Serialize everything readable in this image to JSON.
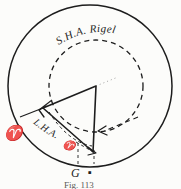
{
  "figure": {
    "background_color": "#fcfcfa",
    "ink_color": "#1d1d1d"
  },
  "labels": {
    "sha_rigel": "S.H.A. Rigel",
    "lha_aries": "L.H.A.",
    "lha_aries_symbol": "♈",
    "aries_point": "♈",
    "greenwich": "G",
    "observer_marker": "▪",
    "caption": "Fig. 113"
  },
  "diagram_data": {
    "type": "geometric-diagram",
    "outer_circle": {
      "cx": 90,
      "cy": 86,
      "r": 82,
      "style": "solid",
      "name": "celestial-equator-horizon"
    },
    "inner_circle": {
      "cx": 96,
      "cy": 86,
      "r": 47,
      "style": "dashed",
      "name": "sha-arc-circle"
    },
    "vertices": {
      "center_apex": {
        "x": 96,
        "y": 86,
        "name": "pole"
      },
      "aries_vertex": {
        "x": 43,
        "y": 108,
        "name": "aries-direction"
      },
      "greenwich_vertex": {
        "x": 93,
        "y": 152,
        "name": "greenwich-meridian"
      }
    },
    "angles": [
      {
        "name": "S.H.A. Rigel",
        "arc": "dashed-upper",
        "label_position": "top"
      },
      {
        "name": "L.H.A. Aries",
        "arc": "dashed-lower-left",
        "label_position": "lower-left"
      }
    ],
    "arrows": [
      {
        "name": "lha-arrow",
        "x": 40,
        "y": 110,
        "direction": "up-left"
      },
      {
        "name": "sha-arrow",
        "x": 99,
        "y": 131,
        "direction": "left"
      },
      {
        "name": "meridian-arrow",
        "x": 95,
        "y": 153,
        "direction": "down-right"
      }
    ]
  }
}
